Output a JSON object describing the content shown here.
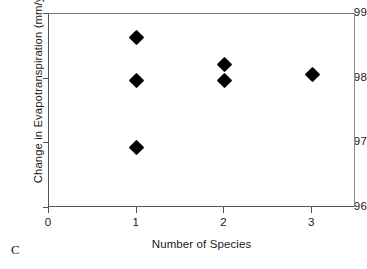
{
  "panel_label": "C",
  "chart_data": {
    "type": "scatter",
    "title": "",
    "xlabel": "Number of Species",
    "ylabel": "Change in Evapotranspiration (mm/yr)",
    "xlim": [
      0,
      3.5
    ],
    "ylim": [
      96,
      99
    ],
    "xticks": [
      0,
      1,
      2,
      3
    ],
    "xtick_labels": [
      "0",
      "1",
      "2",
      "3"
    ],
    "yticks": [
      96,
      97,
      98,
      99
    ],
    "ytick_labels": [
      "96",
      "97",
      "98",
      "99"
    ],
    "grid": false,
    "legend": null,
    "marker": "filled-diamond",
    "marker_color": "#000000",
    "points": [
      {
        "x": 1,
        "y": 98.63
      },
      {
        "x": 1,
        "y": 97.97
      },
      {
        "x": 1,
        "y": 96.93
      },
      {
        "x": 2,
        "y": 98.22
      },
      {
        "x": 2,
        "y": 97.97
      },
      {
        "x": 3,
        "y": 98.06
      }
    ]
  }
}
